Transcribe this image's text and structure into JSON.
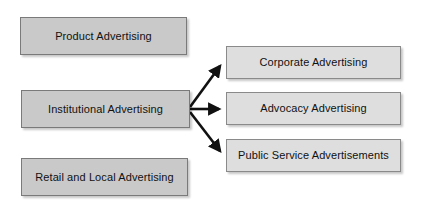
{
  "diagram": {
    "type": "flowchart",
    "title_visible": false,
    "background_color": "#ffffff",
    "left_column": {
      "fill_color": "#c9c9c9",
      "border_color": "#7a7a7a",
      "nodes": [
        {
          "id": "product-advertising",
          "label": "Product Advertising",
          "x": 20,
          "y": 17,
          "w": 167,
          "h": 38
        },
        {
          "id": "institutional-advertising",
          "label": "Institutional Advertising",
          "x": 21,
          "y": 90,
          "w": 169,
          "h": 38
        },
        {
          "id": "retail-and-local-advertising",
          "label": "Retail and Local Advertising",
          "x": 21,
          "y": 158,
          "w": 167,
          "h": 38
        }
      ]
    },
    "right_column": {
      "fill_color": "#dedede",
      "border_color": "#8a8a8a",
      "nodes": [
        {
          "id": "corporate-advertising",
          "label": "Corporate Advertising",
          "x": 226,
          "y": 46,
          "w": 175,
          "h": 33
        },
        {
          "id": "advocacy-advertising",
          "label": "Advocacy Advertising",
          "x": 226,
          "y": 92,
          "w": 175,
          "h": 33
        },
        {
          "id": "public-service-advertisements",
          "label": "Public Service Advertisements",
          "x": 226,
          "y": 139,
          "w": 175,
          "h": 33
        }
      ]
    },
    "connectors": {
      "color": "#111111",
      "stroke_width": 2.6,
      "source_node": "institutional-advertising",
      "edges": [
        {
          "id": "edge-to-corporate",
          "from": "institutional-advertising",
          "to": "corporate-advertising",
          "x1": 190,
          "y1": 107,
          "x2": 224,
          "y2": 62
        },
        {
          "id": "edge-to-advocacy",
          "from": "institutional-advertising",
          "to": "advocacy-advertising",
          "x1": 190,
          "y1": 109,
          "x2": 224,
          "y2": 109
        },
        {
          "id": "edge-to-public-service",
          "from": "institutional-advertising",
          "to": "public-service-advertisements",
          "x1": 190,
          "y1": 112,
          "x2": 224,
          "y2": 155
        }
      ]
    }
  }
}
